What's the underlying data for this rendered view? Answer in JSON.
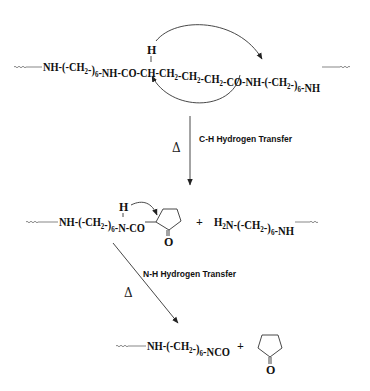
{
  "diagram": {
    "type": "reaction-scheme",
    "row1": {
      "chain_parts": [
        {
          "t": "NH-(-CH"
        },
        {
          "s": "2"
        },
        {
          "t": "-)"
        },
        {
          "s": "6"
        },
        {
          "t": "-NH-CO-CH-CH"
        },
        {
          "s": "2"
        },
        {
          "t": "-CH"
        },
        {
          "s": "2"
        },
        {
          "t": "-CH"
        },
        {
          "s": "2"
        },
        {
          "t": "-CO-NH-(-CH"
        },
        {
          "s": "2"
        },
        {
          "t": "-)"
        },
        {
          "s": "6"
        },
        {
          "t": "-NH"
        }
      ],
      "h_atom": "H"
    },
    "step1": {
      "condition": "Δ",
      "label": "C-H Hydrogen Transfer"
    },
    "row2": {
      "left_parts": [
        {
          "t": "NH-(-CH"
        },
        {
          "s": "2"
        },
        {
          "t": "-)"
        },
        {
          "s": "6"
        },
        {
          "t": "-N-CO"
        }
      ],
      "h_atom": "H",
      "ring_oxygen": "O",
      "plus": "+",
      "right_parts": [
        {
          "t": "H"
        },
        {
          "s": "2"
        },
        {
          "t": "N-(-CH"
        },
        {
          "s": "2"
        },
        {
          "t": "-)"
        },
        {
          "s": "6"
        },
        {
          "t": "-NH"
        }
      ]
    },
    "step2": {
      "condition": "Δ",
      "label": "N-H Hydrogen Transfer"
    },
    "row3": {
      "left_parts": [
        {
          "t": "NH-(-CH"
        },
        {
          "s": "2"
        },
        {
          "t": "-)"
        },
        {
          "s": "6"
        },
        {
          "t": "-NCO"
        }
      ],
      "plus": "+",
      "ring_oxygen": "O"
    }
  }
}
